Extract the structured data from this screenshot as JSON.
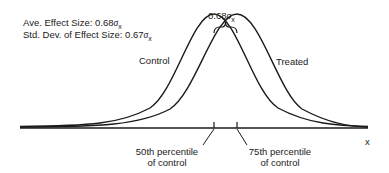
{
  "stats": {
    "ave_label": "Ave. Effect Size:",
    "ave_value": "0.68",
    "ave_unit": "σ",
    "ave_sub": "x",
    "sd_label": "Std. Dev. of Effect Size:",
    "sd_value": "0.67",
    "sd_unit": "σ",
    "sd_sub": "x"
  },
  "brace": {
    "value": "0.68",
    "unit": "σ",
    "sub": "x"
  },
  "curves": {
    "control": "Control",
    "treated": "Treated"
  },
  "axis": {
    "label": "x"
  },
  "markers": {
    "p50_line1": "50th percentile",
    "p50_line2": "of control",
    "p75_line1": "75th percentile",
    "p75_line2": "of control"
  }
}
